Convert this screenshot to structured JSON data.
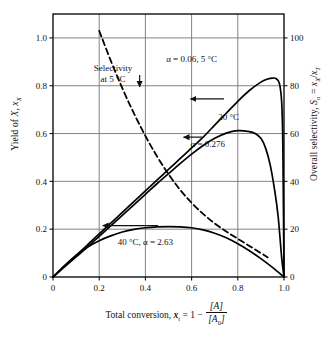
{
  "chart_data": {
    "type": "line",
    "title": "",
    "xlabel": "Total conversion, x_t = 1 - [A]/[A0]",
    "ylabel": "Yield of X, x_X",
    "ylabel_right": "Overall selectivity, S_o = x_X/x_T",
    "xlim": [
      0,
      1.0
    ],
    "ylim": [
      0,
      1.1
    ],
    "ylim_right": [
      0,
      110
    ],
    "grid": true,
    "legend": "annotations-inline",
    "xticks": [
      "0",
      "0.2",
      "0.4",
      "0.6",
      "0.8",
      "1.0"
    ],
    "xtick_values": [
      0,
      0.2,
      0.4,
      0.6,
      0.8,
      1.0
    ],
    "yticks_left": [
      "0",
      "0.2",
      "0.4",
      "0.6",
      "0.8",
      "1.0"
    ],
    "ytick_values_left": [
      0,
      0.2,
      0.4,
      0.6,
      0.8,
      1.0
    ],
    "yticks_right": [
      "0",
      "20",
      "40",
      "60",
      "80",
      "100"
    ],
    "ytick_values_right": [
      0,
      20,
      40,
      60,
      80,
      100
    ],
    "series": [
      {
        "name": "Overall selectivity, alpha = 0.06, 5 C",
        "axis": "right",
        "style": "solid",
        "x": [
          0,
          0.05,
          0.1,
          0.15,
          0.2,
          0.25,
          0.3,
          0.35,
          0.4,
          0.45,
          0.5,
          0.55,
          0.6,
          0.65,
          0.7,
          0.75,
          0.8,
          0.85,
          0.9,
          0.93,
          0.95,
          0.965,
          0.98,
          0.99,
          0.995,
          1.0
        ],
        "values": [
          0,
          4.5,
          9.0,
          13.5,
          18.0,
          22.5,
          27.0,
          31.5,
          36.0,
          40.5,
          45.0,
          49.5,
          54.0,
          58.5,
          63.5,
          68.5,
          73.5,
          78.0,
          81.5,
          82.8,
          83.2,
          83.0,
          81.0,
          73.0,
          55.0,
          0
        ]
      },
      {
        "name": "Overall selectivity, alpha = 0.276, 20 C",
        "axis": "right",
        "style": "solid",
        "x": [
          0,
          0.05,
          0.1,
          0.15,
          0.2,
          0.25,
          0.3,
          0.35,
          0.4,
          0.45,
          0.5,
          0.55,
          0.6,
          0.65,
          0.7,
          0.75,
          0.8,
          0.85,
          0.875,
          0.9,
          0.92,
          0.94,
          0.96,
          0.975,
          0.99,
          1.0
        ],
        "values": [
          0,
          4.2,
          8.4,
          12.6,
          17.0,
          21.4,
          25.8,
          30.2,
          34.6,
          39.0,
          43.2,
          47.4,
          51.4,
          55.0,
          58.0,
          60.2,
          61.2,
          60.8,
          60.0,
          58.0,
          54.0,
          47.0,
          36.0,
          25.0,
          8.0,
          0
        ]
      },
      {
        "name": "Yield of X, 40 C, alpha = 2.63",
        "axis": "left",
        "style": "solid",
        "x": [
          0,
          0.05,
          0.1,
          0.15,
          0.2,
          0.25,
          0.3,
          0.35,
          0.4,
          0.45,
          0.5,
          0.55,
          0.6,
          0.65,
          0.7,
          0.75,
          0.8,
          0.85,
          0.9,
          0.95,
          1.0
        ],
        "values": [
          0,
          0.048,
          0.09,
          0.125,
          0.152,
          0.172,
          0.188,
          0.199,
          0.206,
          0.21,
          0.211,
          0.21,
          0.206,
          0.197,
          0.183,
          0.164,
          0.139,
          0.11,
          0.077,
          0.04,
          0
        ]
      },
      {
        "name": "Selectivity at 5 C",
        "axis": "left",
        "style": "dashed",
        "x": [
          0.2,
          0.25,
          0.3,
          0.35,
          0.4,
          0.45,
          0.5,
          0.55,
          0.6,
          0.65,
          0.7,
          0.75,
          0.8,
          0.85,
          0.9,
          0.93
        ],
        "values": [
          1.03,
          0.905,
          0.79,
          0.685,
          0.59,
          0.505,
          0.43,
          0.365,
          0.31,
          0.264,
          0.224,
          0.19,
          0.16,
          0.13,
          0.1,
          0.082
        ]
      }
    ],
    "annotations": [
      {
        "name": "selectivity-at-5c-label",
        "line1": "Selectivity",
        "line2": "at 5 °C",
        "x": 0.26,
        "y": 0.86
      },
      {
        "name": "alpha-006-5c-label",
        "text": "α = 0.06, 5 °C",
        "x": 0.6,
        "y": 0.9
      },
      {
        "name": "twenty-c-label",
        "text": "20 °C",
        "x": 0.76,
        "y": 0.655
      },
      {
        "name": "alpha-0276-label",
        "text": "α = 0.276",
        "x": 0.67,
        "y": 0.545
      },
      {
        "name": "forty-c-alpha-263-label",
        "text": "40 °C, α = 2.63",
        "x": 0.4,
        "y": 0.133
      }
    ],
    "arrows": [
      {
        "name": "selectivity-down-arrow",
        "direction": "down",
        "x": 0.375,
        "y_from": 0.845,
        "y_to": 0.795
      },
      {
        "name": "upper-selectivity-left-arrow",
        "direction": "left",
        "x_from": 0.74,
        "x_to": 0.595,
        "y": 0.745
      },
      {
        "name": "mid-selectivity-left-arrow",
        "direction": "left",
        "x_from": 0.645,
        "x_to": 0.565,
        "y": 0.585
      },
      {
        "name": "yield-left-arrow",
        "direction": "left",
        "x_from": 0.455,
        "x_to": 0.215,
        "y": 0.215
      }
    ]
  },
  "labels": {
    "ylabel_left_prefix": "Yield of ",
    "ylabel_left_var": "X",
    "ylabel_left_sym": "x",
    "ylabel_left_sub": "X",
    "ylabel_right_prefix": "Overall selectivity, ",
    "ylabel_right_S": "S",
    "ylabel_right_Ssub": "o",
    "ylabel_right_eq": " = ",
    "ylabel_right_num": "x",
    "ylabel_right_numsub": "X",
    "ylabel_right_slash": "/",
    "ylabel_right_den": "x",
    "ylabel_right_densub": "T",
    "xlabel_prefix": "Total conversion, ",
    "xlabel_x": "x",
    "xlabel_xsub": "t",
    "xlabel_eq": " = 1 − ",
    "xlabel_num": "[A]",
    "xlabel_den": "[A",
    "xlabel_den_sub": "0",
    "xlabel_den_end": "]"
  },
  "colors": {
    "axis": "#111111",
    "grid": "#777777",
    "curve": "#000000",
    "background": "#ffffff"
  }
}
